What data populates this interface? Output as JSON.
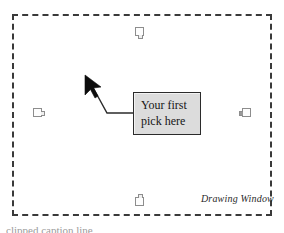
{
  "figure": {
    "name": "drawing-window-figure",
    "background_color": "#ffffff"
  },
  "drawing_window": {
    "label": "Drawing Window",
    "border_style": "dashed",
    "border_color": "#3a3a3a",
    "fill_color": "#ffffff"
  },
  "grips": [
    {
      "name": "grip-top",
      "position": "top",
      "tab_direction": "down"
    },
    {
      "name": "grip-left",
      "position": "left",
      "tab_direction": "right"
    },
    {
      "name": "grip-right",
      "position": "right",
      "tab_direction": "left"
    },
    {
      "name": "grip-bottom",
      "position": "bottom",
      "tab_direction": "up"
    }
  ],
  "callout": {
    "line1": "Your first",
    "line2": "pick here",
    "fill_color": "#dcdcdc",
    "border_color": "#2b2b2b",
    "text_color": "#161616"
  },
  "cursor": {
    "name": "arrow-cursor",
    "color": "#0d0d0d",
    "direction": "up-left"
  },
  "leader": {
    "color": "#2b2b2b"
  },
  "caption": {
    "text": "clipped caption line"
  }
}
